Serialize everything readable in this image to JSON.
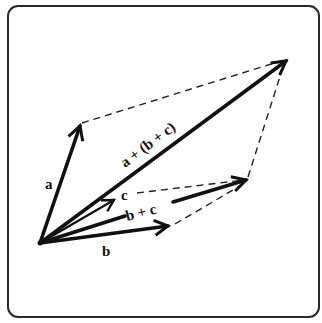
{
  "diagram": {
    "type": "vector-addition",
    "title": "",
    "colors": {
      "ink": "#111111",
      "frame": "#2a2a2a",
      "background": "#ffffff"
    },
    "origin": {
      "x": 40,
      "y": 243
    },
    "vectors": [
      {
        "id": "a",
        "label": "a",
        "from": [
          40,
          243
        ],
        "to": [
          80,
          125
        ],
        "width": 3.6
      },
      {
        "id": "b",
        "label": "b",
        "from": [
          40,
          243
        ],
        "to": [
          170,
          226
        ],
        "width": 3.6
      },
      {
        "id": "c",
        "label": "c",
        "from": [
          40,
          243
        ],
        "to": [
          115,
          200
        ],
        "width": 2.2
      },
      {
        "id": "b_plus_c",
        "label": "b + c",
        "from": [
          40,
          243
        ],
        "to": [
          247,
          180
        ],
        "width": 3.6
      },
      {
        "id": "sum",
        "label": "a + (b + c)",
        "from": [
          40,
          243
        ],
        "to": [
          287,
          60
        ],
        "width": 3.6
      }
    ],
    "dashed_lines": [
      {
        "from": [
          82,
          123
        ],
        "to": [
          286,
          60
        ]
      },
      {
        "from": [
          248,
          177
        ],
        "to": [
          284,
          64
        ]
      },
      {
        "from": [
          137,
          193
        ],
        "to": [
          246,
          180
        ]
      },
      {
        "from": [
          175,
          224
        ],
        "to": [
          247,
          182
        ]
      }
    ],
    "labels": {
      "a": "a",
      "b": "b",
      "c": "c",
      "b_plus_c": "b + c",
      "sum": "a + (b + c)"
    }
  }
}
